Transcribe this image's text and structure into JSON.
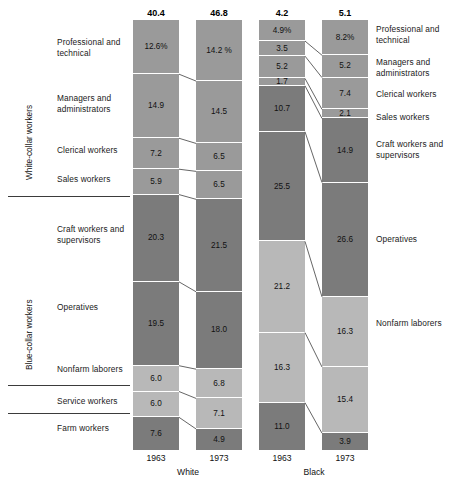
{
  "chart_data": {
    "type": "bar",
    "subtype": "stacked-100-percent",
    "title": "",
    "xlabel": "",
    "ylabel": "",
    "grid": false,
    "legend_position": "none",
    "categories": [
      "Professional and technical",
      "Managers and administrators",
      "Clerical workers",
      "Sales workers",
      "Craft workers and supervisors",
      "Operatives",
      "Nonfarm laborers",
      "Service workers",
      "Farm workers"
    ],
    "columns": [
      "White 1963",
      "White 1973",
      "Black 1963",
      "Black 1973"
    ],
    "column_totals_millions": [
      40.4,
      46.8,
      4.2,
      5.1
    ],
    "series": [
      {
        "name": "White 1963",
        "group": "White",
        "year": "1963",
        "total": "40.4",
        "values": [
          12.6,
          14.9,
          7.2,
          5.9,
          20.3,
          19.5,
          6.0,
          6.0,
          7.6
        ],
        "labels": [
          "12.6%",
          "14.9",
          "7.2",
          "5.9",
          "20.3",
          "19.5",
          "6.0",
          "6.0",
          "7.6"
        ]
      },
      {
        "name": "White 1973",
        "group": "White",
        "year": "1973",
        "total": "46.8",
        "values": [
          14.2,
          14.5,
          6.5,
          6.5,
          21.5,
          18.0,
          6.8,
          7.1,
          4.9
        ],
        "labels": [
          "14.2 %",
          "14.5",
          "6.5",
          "6.5",
          "21.5",
          "18.0",
          "6.8",
          "7.1",
          "4.9"
        ]
      },
      {
        "name": "Black 1963",
        "group": "Black",
        "year": "1963",
        "total": "4.2",
        "values": [
          4.9,
          3.5,
          5.2,
          1.7,
          10.7,
          25.5,
          21.2,
          16.3,
          11.0
        ],
        "labels": [
          "4.9%",
          "3.5",
          "5.2",
          "1.7",
          "10.7",
          "25.5",
          "21.2",
          "16.3",
          "11.0"
        ]
      },
      {
        "name": "Black 1973",
        "group": "Black",
        "year": "1973",
        "total": "5.1",
        "values": [
          8.2,
          5.2,
          7.4,
          2.1,
          14.9,
          26.6,
          16.3,
          15.4,
          3.9
        ],
        "labels": [
          "8.2%",
          "5.2",
          "7.4",
          "2.1",
          "14.9",
          "26.6",
          "16.3",
          "15.4",
          "3.9"
        ]
      }
    ]
  },
  "left_labels": [
    "Professional and\ntechnical",
    "Managers and\nadministrators",
    "Clerical workers",
    "Sales workers",
    "Craft workers and\nsupervisors",
    "Operatives",
    "Nonfarm laborers",
    "Service workers",
    "Farm workers"
  ],
  "right_labels": [
    "Professional and\ntechnical",
    "Managers and\nadministrators",
    "Clerical workers",
    "Sales workers",
    "Craft workers and\nsupervisors",
    "Operatives",
    "Nonfarm laborers"
  ],
  "side_captions": {
    "white_collar": "White-collar workers",
    "blue_collar": "Blue-collar workers"
  },
  "axis": {
    "years": [
      "1963",
      "1973",
      "1963",
      "1973"
    ],
    "groups": [
      "White",
      "Black"
    ]
  },
  "totals": [
    "40.4",
    "46.8",
    "4.2",
    "5.1"
  ],
  "colors": {
    "mid_gray": "#9a9a9a",
    "dark_gray": "#7b7b7b",
    "light_gray": "#b8b8b8",
    "rule": "#3b3b3b",
    "link": "#4a4a4a",
    "text": "#1a1a1a",
    "background": "#ffffff"
  }
}
